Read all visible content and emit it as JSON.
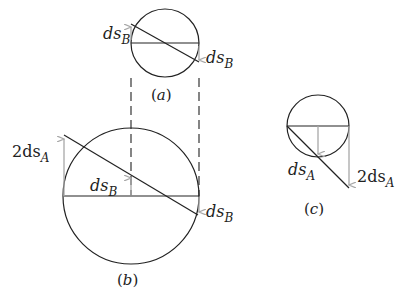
{
  "figure": {
    "panels": [
      {
        "id": "a",
        "caption": "(a)",
        "labels": {
          "left": "ds",
          "left_sub": "B",
          "right": "ds",
          "right_sub": "B"
        }
      },
      {
        "id": "b",
        "caption": "(b)",
        "labels": {
          "top_left": "2ds",
          "top_left_sub": "A",
          "center": "ds",
          "center_sub": "B",
          "right": "ds",
          "right_sub": "B"
        }
      },
      {
        "id": "c",
        "caption": "(c)",
        "labels": {
          "center": "ds",
          "center_sub": "A",
          "right": "2ds",
          "right_sub": "A"
        }
      }
    ],
    "colors": {
      "line": "#222222",
      "arrow": "#a8a8a8",
      "background": "#ffffff"
    }
  }
}
